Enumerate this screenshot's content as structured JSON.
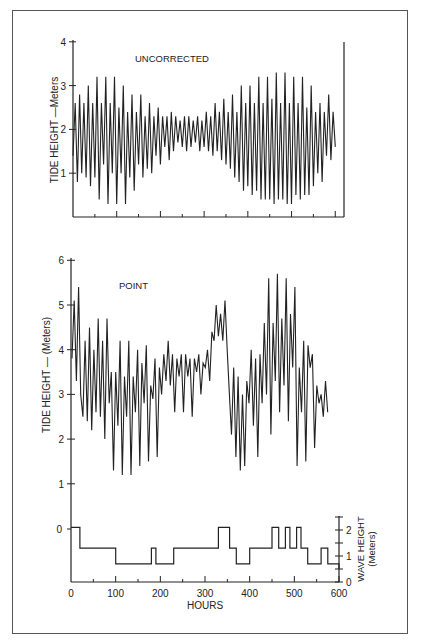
{
  "chart_data": [
    {
      "type": "line",
      "title": "UNCORRECTED",
      "ylabel": "TIDE HEIGHT —Meters",
      "xlabel": "",
      "ylim": [
        0,
        4
      ],
      "yticks": [
        "1",
        "2",
        "3",
        "4"
      ],
      "xlim": [
        0,
        620
      ],
      "grid": false,
      "description": "Mixed semidiurnal tide oscillating ~0.4–3.3 m; amplitude large at start (~0–200 h), minimal near ~280–330 h, large again ~450–600 h",
      "series": [
        {
          "name": "Uncorrected tide height",
          "x": [
            0,
            5,
            10,
            15,
            20,
            25,
            30,
            35,
            40,
            45,
            50,
            55,
            60,
            65,
            70,
            75,
            80,
            85,
            90,
            95,
            100,
            105,
            110,
            115,
            120,
            125,
            130,
            135,
            140,
            145,
            150,
            155,
            160,
            165,
            170,
            175,
            180,
            185,
            190,
            195,
            200,
            205,
            210,
            215,
            220,
            225,
            230,
            235,
            240,
            245,
            250,
            255,
            260,
            265,
            270,
            275,
            280,
            285,
            290,
            295,
            300,
            305,
            310,
            315,
            320,
            325,
            330,
            335,
            340,
            345,
            350,
            355,
            360,
            365,
            370,
            375,
            380,
            385,
            390,
            395,
            400,
            405,
            410,
            415,
            420,
            425,
            430,
            435,
            440,
            445,
            450,
            455,
            460,
            465,
            470,
            475,
            480,
            485,
            490,
            495,
            500,
            505,
            510,
            515,
            520,
            525,
            530,
            535,
            540,
            545,
            550,
            555,
            560,
            565,
            570,
            575,
            580,
            585,
            590,
            595,
            600,
            605,
            610
          ],
          "values": [
            1.4,
            2.6,
            0.8,
            2.8,
            1.0,
            2.6,
            0.9,
            3.0,
            0.7,
            2.6,
            0.9,
            3.2,
            0.4,
            2.6,
            1.2,
            3.2,
            0.3,
            2.6,
            1.0,
            3.2,
            0.3,
            2.5,
            1.0,
            3.0,
            0.3,
            2.4,
            0.9,
            2.8,
            0.6,
            2.4,
            1.2,
            2.8,
            0.9,
            2.3,
            1.1,
            2.6,
            1.0,
            2.3,
            1.4,
            2.5,
            1.2,
            2.3,
            1.6,
            2.3,
            1.3,
            2.4,
            1.5,
            2.3,
            1.7,
            2.2,
            1.6,
            2.3,
            1.5,
            2.3,
            1.6,
            2.2,
            1.7,
            2.3,
            1.5,
            2.2,
            1.6,
            2.4,
            1.5,
            2.3,
            1.4,
            2.6,
            1.5,
            2.4,
            1.3,
            2.7,
            1.2,
            2.4,
            1.1,
            2.8,
            0.9,
            2.4,
            0.8,
            3.0,
            0.6,
            2.6,
            0.7,
            3.0,
            0.5,
            2.6,
            0.6,
            3.2,
            0.4,
            2.6,
            0.4,
            3.2,
            0.4,
            2.7,
            0.3,
            3.3,
            0.4,
            2.6,
            0.4,
            3.3,
            0.3,
            2.6,
            0.3,
            3.2,
            0.5,
            2.6,
            0.4,
            3.2,
            0.5,
            2.5,
            0.5,
            3.0,
            0.7,
            2.4,
            1.0,
            2.6,
            0.8,
            2.4,
            1.4,
            2.8,
            1.3,
            2.4,
            1.6
          ]
        }
      ]
    },
    {
      "type": "line",
      "title": "POINT",
      "ylabel": "TIDE HEIGHT — (Meters)",
      "xlabel": "HOURS",
      "ylim": [
        0,
        6
      ],
      "yticks": [
        "1",
        "2",
        "3",
        "4",
        "5",
        "6"
      ],
      "xlim": [
        0,
        620
      ],
      "grid": false,
      "description": "Tide height at Point, oscillating ~1.2–5.8 m; peak ~5.4 m near start, elevated ~4–5 m plateau ~330–360 h, largest peaks ~5.8 m at 450–510 h",
      "series": [
        {
          "name": "Point tide height",
          "x": [
            0,
            5,
            10,
            15,
            20,
            25,
            30,
            35,
            40,
            45,
            50,
            55,
            60,
            65,
            70,
            75,
            80,
            85,
            90,
            95,
            100,
            105,
            110,
            115,
            120,
            125,
            130,
            135,
            140,
            145,
            150,
            155,
            160,
            165,
            170,
            175,
            180,
            185,
            190,
            195,
            200,
            205,
            210,
            215,
            220,
            225,
            230,
            235,
            240,
            245,
            250,
            255,
            260,
            265,
            270,
            275,
            280,
            285,
            290,
            295,
            300,
            305,
            310,
            315,
            320,
            325,
            330,
            335,
            340,
            345,
            350,
            355,
            360,
            365,
            370,
            375,
            380,
            385,
            390,
            395,
            400,
            405,
            410,
            415,
            420,
            425,
            430,
            435,
            440,
            445,
            450,
            455,
            460,
            465,
            470,
            475,
            480,
            485,
            490,
            495,
            500,
            505,
            510,
            515,
            520,
            525,
            530,
            535,
            540,
            545,
            550,
            555,
            560,
            565,
            570,
            575,
            580,
            585,
            590,
            595,
            600,
            605,
            610
          ],
          "values": [
            3.8,
            5.1,
            3.3,
            5.4,
            3.0,
            2.5,
            4.2,
            2.4,
            4.5,
            2.2,
            4.0,
            2.6,
            4.7,
            2.5,
            4.2,
            2.0,
            4.7,
            2.8,
            3.5,
            1.3,
            3.5,
            2.3,
            4.2,
            1.2,
            3.4,
            2.5,
            4.2,
            1.2,
            3.4,
            2.6,
            4.0,
            1.4,
            3.7,
            2.8,
            4.1,
            1.5,
            3.2,
            2.9,
            3.8,
            1.6,
            3.6,
            3.0,
            3.9,
            3.3,
            4.2,
            3.2,
            3.9,
            2.6,
            3.8,
            3.4,
            3.9,
            2.6,
            3.9,
            3.4,
            3.8,
            2.5,
            3.8,
            3.5,
            3.9,
            3.0,
            3.7,
            3.6,
            4.0,
            3.3,
            4.4,
            4.2,
            5.0,
            4.3,
            4.8,
            4.2,
            5.1,
            4.0,
            3.0,
            2.1,
            3.6,
            1.6,
            3.4,
            1.3,
            3.0,
            1.4,
            3.3,
            2.8,
            4.0,
            2.3,
            3.8,
            1.6,
            3.9,
            2.8,
            4.6,
            3.0,
            5.6,
            2.1,
            4.6,
            3.3,
            5.7,
            2.6,
            4.7,
            3.2,
            5.6,
            2.4,
            4.8,
            3.6,
            5.4,
            1.4,
            3.6,
            2.6,
            4.2,
            1.5,
            4.1,
            3.6,
            3.9,
            1.8,
            3.2,
            2.8,
            3.0,
            2.5,
            3.3,
            2.6
          ]
        }
      ]
    },
    {
      "type": "line",
      "title": "",
      "ylabel": "WAVE HEIGHT (Meters)",
      "xlabel": "HOURS",
      "ylim": [
        0,
        2.5
      ],
      "yticks": [
        "0",
        "1",
        "2"
      ],
      "xticks": [
        "0",
        "100",
        "200",
        "300",
        "400",
        "500",
        "600"
      ],
      "xlim": [
        0,
        620
      ],
      "left_axis_tick": "0",
      "step": true,
      "grid": false,
      "series": [
        {
          "name": "Wave height (step)",
          "x": [
            0,
            20,
            20,
            100,
            100,
            180,
            180,
            190,
            190,
            230,
            230,
            330,
            330,
            355,
            355,
            370,
            370,
            400,
            400,
            450,
            450,
            465,
            465,
            480,
            480,
            490,
            490,
            505,
            505,
            515,
            515,
            530,
            530,
            560,
            560,
            575,
            575,
            600,
            600
          ],
          "values": [
            2.1,
            2.1,
            1.3,
            1.3,
            0.7,
            0.7,
            1.3,
            1.3,
            0.7,
            0.7,
            1.3,
            1.3,
            2.1,
            2.1,
            1.3,
            1.3,
            0.7,
            0.7,
            1.3,
            1.3,
            2.1,
            2.1,
            1.3,
            1.3,
            2.1,
            2.1,
            1.3,
            1.3,
            2.1,
            2.1,
            1.3,
            1.3,
            0.7,
            0.7,
            1.3,
            1.3,
            0.7,
            0.7,
            0.5
          ]
        }
      ]
    }
  ],
  "labels": {
    "top_title": "UNCORRECTED",
    "top_ylabel": "TIDE HEIGHT —Meters",
    "bottom_title": "POINT",
    "bottom_ylabel": "TIDE HEIGHT — (Meters)",
    "wave_ylabel_line1": "WAVE HEIGHT",
    "wave_ylabel_line2": "(Meters)",
    "xlabel": "HOURS",
    "top_yticks": [
      "1",
      "2",
      "3",
      "4"
    ],
    "bottom_yticks": [
      "1",
      "2",
      "3",
      "4",
      "5",
      "6"
    ],
    "wave_left_tick": "0",
    "wave_right_ticks": [
      "0",
      "1",
      "2"
    ],
    "xticks": [
      "0",
      "100",
      "200",
      "300",
      "400",
      "500",
      "600"
    ]
  },
  "colors": {
    "line": "#222222",
    "frame": "#555555",
    "background": "#ffffff"
  }
}
